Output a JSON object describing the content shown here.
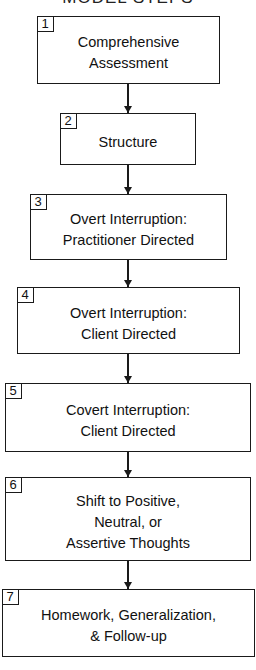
{
  "diagram": {
    "title": "MODEL STEPS",
    "steps": [
      {
        "number": "1",
        "line1": "Comprehensive",
        "line2": "Assessment",
        "line3": ""
      },
      {
        "number": "2",
        "line1": "Structure",
        "line2": "",
        "line3": ""
      },
      {
        "number": "3",
        "line1": "Overt Interruption:",
        "line2": "Practitioner Directed",
        "line3": ""
      },
      {
        "number": "4",
        "line1": "Overt Interruption:",
        "line2": "Client Directed",
        "line3": ""
      },
      {
        "number": "5",
        "line1": "Covert Interruption:",
        "line2": "Client Directed",
        "line3": ""
      },
      {
        "number": "6",
        "line1": "Shift to Positive,",
        "line2": "Neutral, or",
        "line3": "Assertive Thoughts"
      },
      {
        "number": "7",
        "line1": "Homework, Generalization,",
        "line2": "& Follow-up",
        "line3": ""
      }
    ],
    "colors": {
      "stroke": "#1a1a1a",
      "background": "#ffffff"
    }
  }
}
